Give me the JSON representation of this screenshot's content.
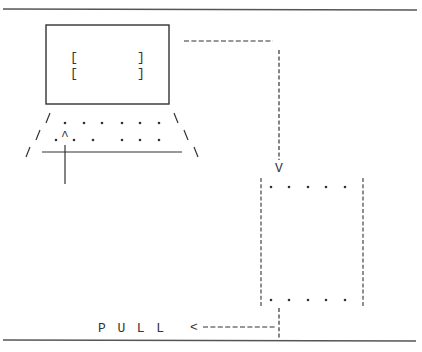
{
  "diagram": {
    "type": "ascii-flow",
    "colors": {
      "ink": "#333333",
      "rule": "#555555",
      "background": "#ffffff"
    },
    "computer": {
      "screen_brackets": [
        {
          "left": "[",
          "right": "]"
        },
        {
          "left": "[",
          "right": "]"
        }
      ],
      "keyboard_rows": [
        {
          "dots": 6
        },
        {
          "dots": 6
        }
      ],
      "cursor_glyph": "^"
    },
    "arrows": {
      "down_head": "V",
      "left_head": "<"
    },
    "target_box": {
      "top_dots": 5,
      "bottom_dots": 5
    },
    "label": "P U L L"
  }
}
